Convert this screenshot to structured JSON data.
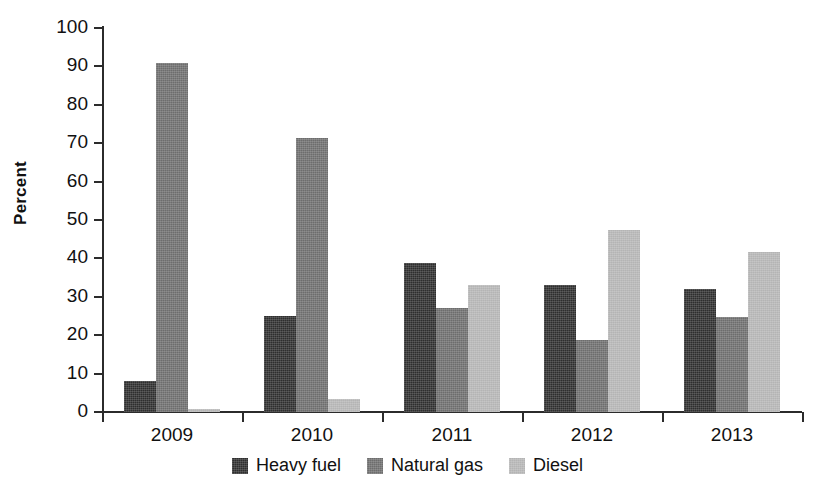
{
  "chart_data": {
    "type": "bar",
    "title": "",
    "subtitle": "",
    "xlabel": "",
    "ylabel": "Percent",
    "categories": [
      "2009",
      "2010",
      "2011",
      "2012",
      "2013"
    ],
    "series": [
      {
        "name": "Heavy fuel",
        "color": "#2e2e2e",
        "values": [
          8.2,
          25.0,
          38.8,
          33.2,
          32.0
        ]
      },
      {
        "name": "Natural gas",
        "color": "#6d6d6d",
        "values": [
          91.0,
          71.3,
          27.2,
          18.7,
          24.8
        ]
      },
      {
        "name": "Diesel",
        "color": "#b4b4b4",
        "values": [
          0.8,
          3.4,
          33.1,
          47.5,
          41.7
        ]
      }
    ],
    "ylim": [
      0,
      100
    ],
    "ytick_values": [
      0,
      10,
      20,
      30,
      40,
      50,
      60,
      70,
      80,
      90,
      100
    ],
    "ytick_labels": [
      "0",
      "10",
      "20",
      "30",
      "40",
      "50",
      "60",
      "70",
      "80",
      "90",
      "100"
    ],
    "grid": false,
    "legend_position": "bottom",
    "legend_entries": [
      "Heavy fuel",
      "Natural gas",
      "Diesel"
    ]
  },
  "axis": {
    "y_title": "Percent",
    "axis_color": "#2b2b2b"
  }
}
